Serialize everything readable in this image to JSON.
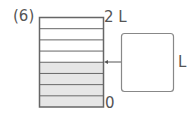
{
  "problem": {
    "number_label": "(6)"
  },
  "container": {
    "max_label": "2 L",
    "min_label": "0",
    "divisions": 8,
    "filled_divisions": 4,
    "fill_color": "#e6e6e6",
    "line_color": "#666666",
    "capacity_liters": 2
  },
  "answer": {
    "box_value": "",
    "unit_label": "L"
  }
}
